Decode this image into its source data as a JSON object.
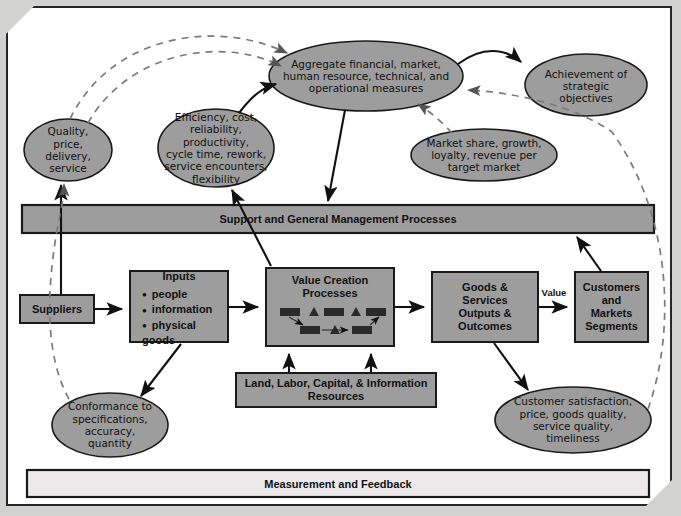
{
  "diagram": {
    "colors": {
      "shape_fill": "#9d9d9d",
      "shape_stroke": "#1a1a1a",
      "bar_fill": "#9d9d9d",
      "bottom_bar_fill": "#eceaea",
      "page_background": "#d2d2d0",
      "sheet_background": "#ffffff",
      "arrow_color": "#111111",
      "dashed_color": "#7b7b7b"
    },
    "bars": [
      {
        "id": "support-bar",
        "label": "Support and General Management Processes"
      },
      {
        "id": "measurement-bar",
        "label": "Measurement and Feedback"
      }
    ],
    "ellipses": [
      {
        "id": "aggregate-measures",
        "lines": [
          "Aggregate financial, market,",
          "human resource, technical, and",
          "operational measures"
        ]
      },
      {
        "id": "achievement-objectives",
        "lines": [
          "Achievement of",
          "strategic",
          "objectives"
        ]
      },
      {
        "id": "efficiency-cost",
        "lines": [
          "Efficiency, cost,",
          "reliability, productivity,",
          "cycle time, rework,",
          "service encounters,",
          "flexibility"
        ]
      },
      {
        "id": "market-share",
        "lines": [
          "Market share, growth,",
          "loyalty, revenue per",
          "target market"
        ]
      },
      {
        "id": "quality-price",
        "lines": [
          "Quality,",
          "price,",
          "delivery,",
          "service"
        ]
      },
      {
        "id": "conformance",
        "lines": [
          "Conformance to",
          "specifications,",
          "accuracy,",
          "quantity"
        ]
      },
      {
        "id": "customer-satisfaction",
        "lines": [
          "Customer satisfaction,",
          "price, goods quality,",
          "service quality,",
          "timeliness"
        ]
      }
    ],
    "boxes": [
      {
        "id": "suppliers",
        "lines": [
          "Suppliers"
        ]
      },
      {
        "id": "inputs",
        "title": "Inputs",
        "bullets": [
          "people",
          "information",
          "physical goods"
        ]
      },
      {
        "id": "value-creation",
        "lines": [
          "Value Creation",
          "Processes"
        ]
      },
      {
        "id": "goods-services",
        "lines": [
          "Goods &",
          "Services",
          "Outputs &",
          "Outcomes"
        ]
      },
      {
        "id": "customers-markets",
        "lines": [
          "Customers",
          "and",
          "Markets",
          "Segments"
        ]
      },
      {
        "id": "resources",
        "lines": [
          "Land, Labor, Capital, & Information",
          "Resources"
        ]
      }
    ],
    "edge_labels": [
      {
        "id": "value-label",
        "text": "Value"
      }
    ]
  }
}
